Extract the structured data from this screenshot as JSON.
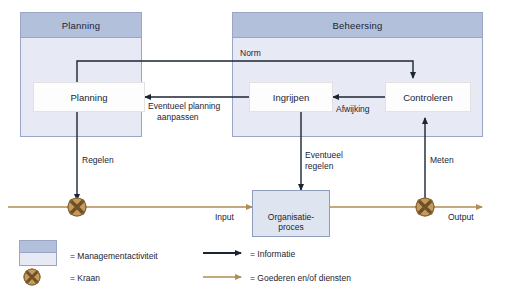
{
  "diagram": {
    "panels": [
      {
        "id": "planning-panel",
        "title": "Planning"
      },
      {
        "id": "beheersing-panel",
        "title": "Beheersing"
      }
    ],
    "activity_boxes": [
      {
        "id": "planning-box",
        "label": "Planning"
      },
      {
        "id": "ingrijpen-box",
        "label": "Ingrijpen"
      },
      {
        "id": "controleren-box",
        "label": "Controleren"
      }
    ],
    "process_box": {
      "line1": "Organisatie-",
      "line2": "proces"
    },
    "flow_labels": {
      "norm": "Norm",
      "eventueel_planning_aanpassen_line1": "Eventueel planning",
      "eventueel_planning_aanpassen_line2": "aanpassen",
      "afwijking": "Afwijking",
      "regelen": "Regelen",
      "eventueel_regelen_line1": "Eventueel",
      "eventueel_regelen_line2": "regelen",
      "meten": "Meten",
      "input": "Input",
      "output": "Output"
    }
  },
  "legend": {
    "items": [
      {
        "id": "legend-management",
        "icon": "panel-swatch-icon",
        "label": "= Managementactiviteit"
      },
      {
        "id": "legend-kraan",
        "icon": "valve-icon",
        "label": "= Kraan"
      },
      {
        "id": "legend-informatie",
        "icon": "black-arrow-icon",
        "label": "= Informatie"
      },
      {
        "id": "legend-goederen",
        "icon": "tan-arrow-icon",
        "label": "= Goederen en/of diensten"
      }
    ]
  },
  "colors": {
    "panel_header": "#b3c0db",
    "panel_fill": "#e7eaf4",
    "panel_border": "#9aa6c4",
    "process_fill": "#dfe4f1",
    "information_arrow": "#1c2433",
    "goods_arrow": "#b08d55",
    "valve_fill": "#c79a5b",
    "text": "#1c2433"
  }
}
